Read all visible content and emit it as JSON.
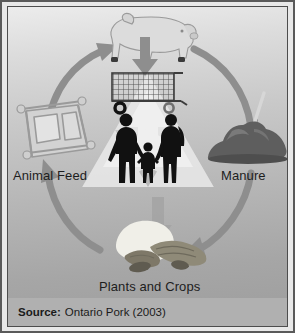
{
  "figure": {
    "background_color": "#b9b9b9",
    "border_color": "#4d4d4d",
    "arrow_color": "#8c8c8c",
    "recycle_symbol_color": "#e4e4e4",
    "silhouette_color": "#111111"
  },
  "labels": {
    "animal_feed": "Animal Feed",
    "manure": "Manure",
    "plants_and_crops": "Plants and Crops"
  },
  "nodes": [
    {
      "id": "pig",
      "icon": "pig-icon",
      "label": ""
    },
    {
      "id": "manure",
      "icon": "manure-pile-icon",
      "label": "Manure"
    },
    {
      "id": "crops",
      "icon": "plants-crops-icon",
      "label": "Plants and Crops"
    },
    {
      "id": "feed",
      "icon": "feed-trough-icon",
      "label": "Animal Feed"
    },
    {
      "id": "consumers",
      "icon": "family-silhouette-icon",
      "label": ""
    },
    {
      "id": "retail",
      "icon": "shopping-cart-icon",
      "label": ""
    }
  ],
  "icons": {
    "pig": "pig-icon",
    "shopping_cart": "shopping-cart-icon",
    "family": "family-silhouette-icon",
    "feed_trough": "feed-trough-icon",
    "manure_pile": "manure-pile-icon",
    "pitchfork": "pitchfork-icon",
    "plants_crops": "plants-crops-icon",
    "recycle": "recycle-symbol-icon",
    "down_arrow": "down-arrow-icon",
    "cycle_arrow": "curved-arrow-icon"
  },
  "caption": {
    "source_word": "Source:",
    "source_text": "Ontario Pork (2003)"
  }
}
